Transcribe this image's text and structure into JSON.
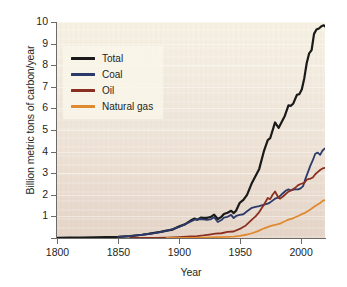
{
  "chart_data": {
    "type": "line",
    "title": "",
    "xlabel": "Year",
    "ylabel": "Billion metric tons of carbon/year",
    "xlim": [
      1800,
      2020
    ],
    "ylim": [
      0,
      10
    ],
    "xticks": [
      "1800",
      "1850",
      "1900",
      "1950",
      "2000"
    ],
    "xtick_values": [
      1800,
      1850,
      1900,
      1950,
      2000
    ],
    "yticks": [
      "1",
      "2",
      "3",
      "4",
      "5",
      "6",
      "7",
      "8",
      "9",
      "10"
    ],
    "ytick_values": [
      1,
      2,
      3,
      4,
      5,
      6,
      7,
      8,
      9,
      10
    ],
    "grid": true,
    "legend_position": "upper left",
    "series": [
      {
        "name": "Total",
        "color": "#1a1a1a",
        "x": [
          1800,
          1810,
          1820,
          1830,
          1840,
          1850,
          1860,
          1870,
          1875,
          1880,
          1885,
          1890,
          1895,
          1900,
          1905,
          1910,
          1913,
          1915,
          1918,
          1920,
          1923,
          1926,
          1929,
          1932,
          1935,
          1937,
          1940,
          1943,
          1945,
          1947,
          1950,
          1953,
          1956,
          1960,
          1963,
          1966,
          1970,
          1973,
          1975,
          1979,
          1980,
          1982,
          1984,
          1987,
          1990,
          1992,
          1994,
          1997,
          1999,
          2001,
          2003,
          2005,
          2007,
          2009,
          2011,
          2013,
          2015,
          2017,
          2019,
          2020
        ],
        "y": [
          0.01,
          0.02,
          0.02,
          0.03,
          0.04,
          0.05,
          0.09,
          0.15,
          0.19,
          0.24,
          0.28,
          0.34,
          0.39,
          0.53,
          0.63,
          0.82,
          0.9,
          0.84,
          0.94,
          0.93,
          0.93,
          0.97,
          1.08,
          0.88,
          0.98,
          1.11,
          1.17,
          1.26,
          1.15,
          1.26,
          1.63,
          1.76,
          2.0,
          2.55,
          2.87,
          3.2,
          4.05,
          4.53,
          4.62,
          5.35,
          5.26,
          5.1,
          5.32,
          5.65,
          6.14,
          6.12,
          6.23,
          6.63,
          6.66,
          6.89,
          7.4,
          8.1,
          8.55,
          8.7,
          9.45,
          9.65,
          9.7,
          9.8,
          9.85,
          9.8
        ],
        "end_value": 9.8
      },
      {
        "name": "Coal",
        "color": "#2b3a6b",
        "x": [
          1850,
          1860,
          1870,
          1880,
          1890,
          1900,
          1910,
          1913,
          1918,
          1920,
          1923,
          1926,
          1929,
          1932,
          1935,
          1937,
          1940,
          1943,
          1945,
          1947,
          1950,
          1953,
          1956,
          1960,
          1963,
          1966,
          1970,
          1973,
          1975,
          1979,
          1982,
          1985,
          1988,
          1990,
          1992,
          1995,
          1998,
          2000,
          2002,
          2004,
          2006,
          2008,
          2010,
          2012,
          2014,
          2016,
          2018,
          2020
        ],
        "y": [
          0.05,
          0.09,
          0.15,
          0.23,
          0.33,
          0.5,
          0.77,
          0.85,
          0.88,
          0.86,
          0.84,
          0.86,
          0.96,
          0.74,
          0.83,
          0.94,
          0.98,
          1.07,
          0.92,
          1.02,
          1.07,
          1.1,
          1.24,
          1.4,
          1.44,
          1.48,
          1.55,
          1.59,
          1.65,
          1.82,
          1.88,
          2.05,
          2.2,
          2.25,
          2.2,
          2.25,
          2.25,
          2.3,
          2.4,
          2.75,
          3.05,
          3.35,
          3.6,
          3.9,
          3.95,
          3.85,
          4.05,
          4.15
        ],
        "end_value": 4.15
      },
      {
        "name": "Oil",
        "color": "#8b2f20",
        "x": [
          1860,
          1870,
          1880,
          1890,
          1900,
          1910,
          1915,
          1920,
          1925,
          1930,
          1935,
          1940,
          1945,
          1950,
          1955,
          1960,
          1963,
          1966,
          1970,
          1973,
          1975,
          1977,
          1979,
          1980,
          1982,
          1983,
          1985,
          1988,
          1990,
          1992,
          1995,
          1998,
          2000,
          2003,
          2005,
          2008,
          2010,
          2012,
          2014,
          2016,
          2018,
          2020
        ],
        "y": [
          0.0,
          0.01,
          0.01,
          0.02,
          0.04,
          0.07,
          0.09,
          0.12,
          0.16,
          0.2,
          0.22,
          0.28,
          0.3,
          0.42,
          0.58,
          0.85,
          1.0,
          1.2,
          1.55,
          1.85,
          1.8,
          2.0,
          2.15,
          2.05,
          1.85,
          1.82,
          1.9,
          2.05,
          2.15,
          2.2,
          2.3,
          2.45,
          2.5,
          2.55,
          2.7,
          2.75,
          2.8,
          2.95,
          3.05,
          3.15,
          3.22,
          3.25
        ],
        "end_value": 3.25
      },
      {
        "name": "Natural gas",
        "color": "#e08a30",
        "x": [
          1890,
          1900,
          1910,
          1920,
          1930,
          1940,
          1945,
          1950,
          1955,
          1960,
          1965,
          1970,
          1975,
          1978,
          1980,
          1983,
          1985,
          1988,
          1990,
          1993,
          1995,
          1998,
          2000,
          2003,
          2005,
          2008,
          2010,
          2012,
          2014,
          2016,
          2018,
          2020
        ],
        "y": [
          0.0,
          0.01,
          0.01,
          0.02,
          0.04,
          0.05,
          0.06,
          0.1,
          0.15,
          0.22,
          0.32,
          0.45,
          0.55,
          0.6,
          0.62,
          0.66,
          0.72,
          0.8,
          0.85,
          0.9,
          0.95,
          1.02,
          1.08,
          1.15,
          1.22,
          1.32,
          1.4,
          1.48,
          1.55,
          1.62,
          1.72,
          1.75
        ],
        "end_value": 1.75
      }
    ]
  },
  "legend": {
    "items": [
      {
        "label": "Total",
        "color": "#1a1a1a"
      },
      {
        "label": "Coal",
        "color": "#2b3a6b"
      },
      {
        "label": "Oil",
        "color": "#8b2f20"
      },
      {
        "label": "Natural gas",
        "color": "#e08a30"
      }
    ]
  },
  "axes": {
    "y_title": "Billion metric tons of carbon/year",
    "x_title": "Year"
  },
  "colors": {
    "total": "#1a1a1a",
    "coal": "#2b3a6b",
    "oil": "#8b2f20",
    "natural_gas": "#e08a30",
    "plot_background_top": "#f6f1e2",
    "plot_background_bottom": "#e5d5c8",
    "axis": "#6e6a66",
    "text": "#231f1c"
  }
}
